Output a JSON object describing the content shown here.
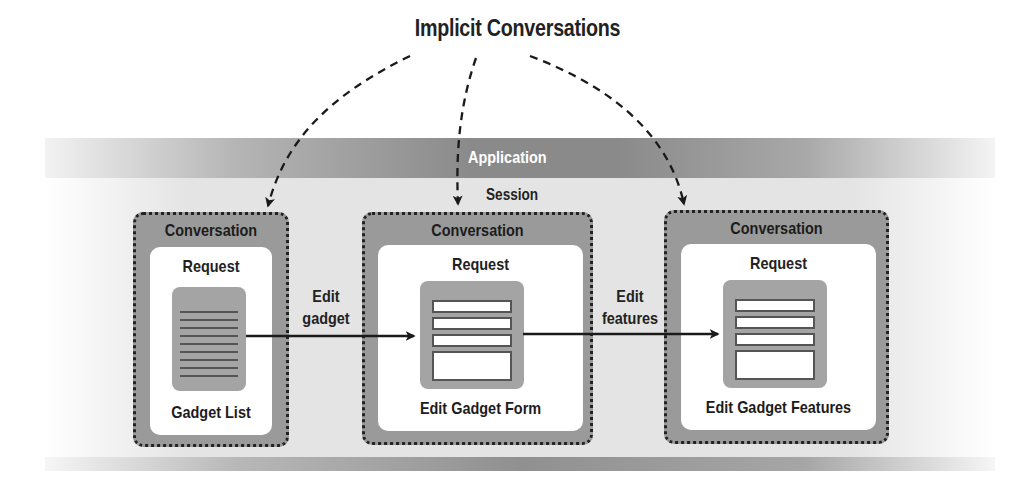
{
  "title": "Implicit Conversations",
  "scopes": {
    "application": "Application",
    "session": "Session"
  },
  "conversations": [
    {
      "label": "Conversation",
      "request_label": "Request",
      "page_name": "Gadget List",
      "page_type": "list"
    },
    {
      "label": "Conversation",
      "request_label": "Request",
      "page_name": "Edit Gadget Form",
      "page_type": "form"
    },
    {
      "label": "Conversation",
      "request_label": "Request",
      "page_name": "Edit Gadget Features",
      "page_type": "form"
    }
  ],
  "transitions": [
    {
      "from": 0,
      "to": 1,
      "label_line1": "Edit",
      "label_line2": "gadget"
    },
    {
      "from": 1,
      "to": 2,
      "label_line1": "Edit",
      "label_line2": "features"
    }
  ],
  "colors": {
    "conversation_fill": "#9a9a9a",
    "request_fill": "#ffffff",
    "document_fill": "#a4a4a4",
    "band_dark": "#8a8a8a",
    "session_fill": "#e4e4e4",
    "text": "#222222"
  }
}
